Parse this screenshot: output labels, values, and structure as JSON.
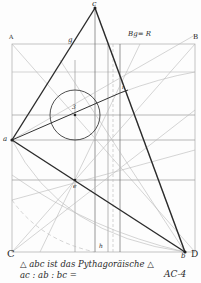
{
  "drawing": {
    "title_note": "Bg= R",
    "corner_labels": {
      "A": "A",
      "B": "B",
      "C": "C",
      "D": "D"
    },
    "point_labels": {
      "apex": "c",
      "left": "a",
      "right": "b",
      "circle_center": "3",
      "inner": "e",
      "upper_right": "i",
      "on_ca": "g",
      "bottom_mid": "h"
    },
    "caption_line1": "△ abc ist das Pythagoräische △",
    "caption_line2": "ac : ab : bc =",
    "sheet_id": "AC-4"
  }
}
